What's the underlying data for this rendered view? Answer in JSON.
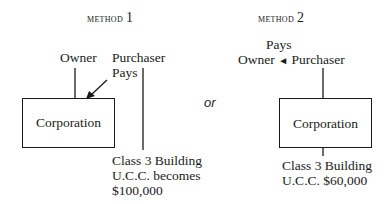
{
  "method1": {
    "title_word": "Method",
    "title_num": "1",
    "owner_label": "Owner",
    "purchaser_label": "Purchaser",
    "pays_label": "Pays",
    "box_label": "Corporation",
    "caption": [
      "Class 3 Building",
      "U.C.C. becomes",
      "$100,000"
    ]
  },
  "connector": {
    "label": "or"
  },
  "method2": {
    "title_word": "Method",
    "title_num": "2",
    "pays_label": "Pays",
    "owner_label": "Owner",
    "arrow_glyph": "◄",
    "purchaser_label": "Purchaser",
    "box_label": "Corporation",
    "caption": [
      "Class 3 Building",
      "U.C.C. $60,000"
    ]
  }
}
